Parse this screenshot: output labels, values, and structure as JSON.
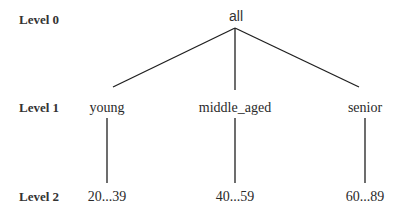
{
  "diagram": {
    "type": "concept-hierarchy-tree",
    "levels": [
      {
        "label": "Level 0"
      },
      {
        "label": "Level 1"
      },
      {
        "label": "Level 2"
      }
    ],
    "root": {
      "label": "all"
    },
    "branches": [
      {
        "level1": "young",
        "level2": "20...39"
      },
      {
        "level1": "middle_aged",
        "level2": "40...59"
      },
      {
        "level1": "senior",
        "level2": "60...89"
      }
    ],
    "edges": [
      {
        "from": "all",
        "to": "young"
      },
      {
        "from": "all",
        "to": "middle_aged"
      },
      {
        "from": "all",
        "to": "senior"
      },
      {
        "from": "young",
        "to": "20...39"
      },
      {
        "from": "middle_aged",
        "to": "40...59"
      },
      {
        "from": "senior",
        "to": "60...89"
      }
    ]
  }
}
